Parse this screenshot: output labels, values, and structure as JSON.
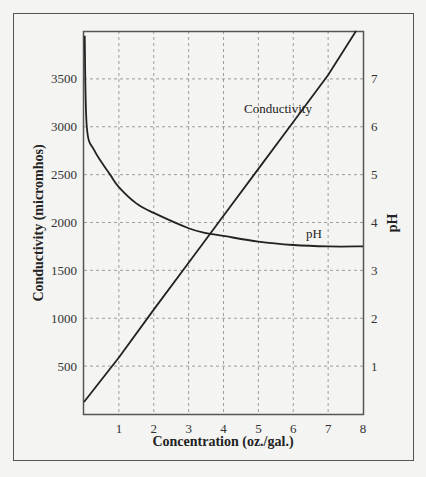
{
  "chart_data": {
    "type": "line",
    "title": "",
    "xlabel": "Concentration (oz./gal.)",
    "ylabel": "Conductivity (micromhos)",
    "y2label": "pH",
    "xlim": [
      0,
      8
    ],
    "ylim": [
      0,
      4000
    ],
    "y2lim": [
      0,
      8
    ],
    "x_ticks": [
      "1",
      "2",
      "3",
      "4",
      "5",
      "6",
      "7",
      "8"
    ],
    "y_ticks": [
      "500",
      "1000",
      "1500",
      "2000",
      "2500",
      "3000",
      "3500"
    ],
    "y2_ticks": [
      "1",
      "2",
      "3",
      "4",
      "5",
      "6",
      "7"
    ],
    "grid": true,
    "legend": "inline labels",
    "series": [
      {
        "name": "Conductivity",
        "axis": "left",
        "x": [
          0,
          1,
          2,
          3,
          4,
          5,
          6,
          7,
          7.8
        ],
        "values": [
          125,
          590,
          1090,
          1580,
          2070,
          2560,
          3050,
          3540,
          4000
        ]
      },
      {
        "name": "pH",
        "axis": "right",
        "x": [
          0.02,
          0.08,
          0.3,
          0.75,
          1,
          1.5,
          2,
          3,
          3.5,
          4,
          5,
          6,
          7,
          8
        ],
        "values": [
          7.9,
          6.0,
          5.5,
          5.0,
          4.74,
          4.4,
          4.2,
          3.88,
          3.78,
          3.72,
          3.6,
          3.53,
          3.5,
          3.5
        ]
      }
    ],
    "annotations": [
      "Conductivity",
      "pH"
    ]
  },
  "labels": {
    "xlabel": "Concentration (oz./gal.)",
    "ylabel": "Conductivity (micromhos)",
    "y2label": "pH",
    "conductivity": "Conductivity",
    "ph": "pH"
  },
  "ticks": {
    "x": [
      "1",
      "2",
      "3",
      "4",
      "5",
      "6",
      "7",
      "8"
    ],
    "y": [
      "500",
      "1000",
      "1500",
      "2000",
      "2500",
      "3000",
      "3500"
    ],
    "y2": [
      "1",
      "2",
      "3",
      "4",
      "5",
      "6",
      "7"
    ]
  }
}
